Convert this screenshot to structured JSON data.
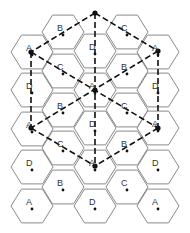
{
  "diagram": {
    "hex_radius": 21,
    "cells": [
      {
        "col": 0,
        "x": 32,
        "y": 52,
        "label": "A"
      },
      {
        "col": 0,
        "x": 32,
        "y": 90,
        "label": "D"
      },
      {
        "col": 0,
        "x": 32,
        "y": 129,
        "label": "A"
      },
      {
        "col": 0,
        "x": 32,
        "y": 167,
        "label": "D"
      },
      {
        "col": 0,
        "x": 32,
        "y": 206,
        "label": "A"
      },
      {
        "col": 1,
        "x": 63,
        "y": 32,
        "label": "B"
      },
      {
        "col": 1,
        "x": 63,
        "y": 71,
        "label": "C"
      },
      {
        "col": 1,
        "x": 63,
        "y": 110,
        "label": "B"
      },
      {
        "col": 1,
        "x": 63,
        "y": 148,
        "label": "C"
      },
      {
        "col": 1,
        "x": 63,
        "y": 187,
        "label": "B"
      },
      {
        "col": 2,
        "x": 95,
        "y": 51,
        "label": "D"
      },
      {
        "col": 2,
        "x": 95,
        "y": 90,
        "label": "A"
      },
      {
        "col": 2,
        "x": 95,
        "y": 128,
        "label": "D"
      },
      {
        "col": 2,
        "x": 95,
        "y": 167,
        "label": "A"
      },
      {
        "col": 2,
        "x": 95,
        "y": 206,
        "label": "D"
      },
      {
        "col": 3,
        "x": 127,
        "y": 32,
        "label": "C"
      },
      {
        "col": 3,
        "x": 127,
        "y": 71,
        "label": "B"
      },
      {
        "col": 3,
        "x": 127,
        "y": 110,
        "label": "C"
      },
      {
        "col": 3,
        "x": 127,
        "y": 148,
        "label": "B"
      },
      {
        "col": 3,
        "x": 127,
        "y": 187,
        "label": "C"
      },
      {
        "col": 4,
        "x": 158,
        "y": 52,
        "label": "A"
      },
      {
        "col": 4,
        "x": 158,
        "y": 90,
        "label": "D"
      },
      {
        "col": 4,
        "x": 158,
        "y": 128,
        "label": "A"
      },
      {
        "col": 4,
        "x": 158,
        "y": 167,
        "label": "D"
      },
      {
        "col": 4,
        "x": 158,
        "y": 206,
        "label": "A"
      }
    ],
    "vertices": [
      {
        "name": "top",
        "x": 95,
        "y": 13
      },
      {
        "name": "upper-left",
        "x": 31,
        "y": 52
      },
      {
        "name": "upper-right",
        "x": 158,
        "y": 51
      },
      {
        "name": "center",
        "x": 95,
        "y": 90
      },
      {
        "name": "lower-left",
        "x": 31,
        "y": 128
      },
      {
        "name": "lower-right",
        "x": 158,
        "y": 128
      },
      {
        "name": "bottom",
        "x": 95,
        "y": 166
      }
    ],
    "dashed_lines": [
      [
        "top",
        "upper-left"
      ],
      [
        "top",
        "upper-right"
      ],
      [
        "top",
        "bottom"
      ],
      [
        "upper-left",
        "lower-left"
      ],
      [
        "upper-right",
        "lower-right"
      ],
      [
        "upper-left",
        "lower-right"
      ],
      [
        "upper-right",
        "lower-left"
      ],
      [
        "lower-left",
        "bottom"
      ],
      [
        "lower-right",
        "bottom"
      ]
    ]
  }
}
